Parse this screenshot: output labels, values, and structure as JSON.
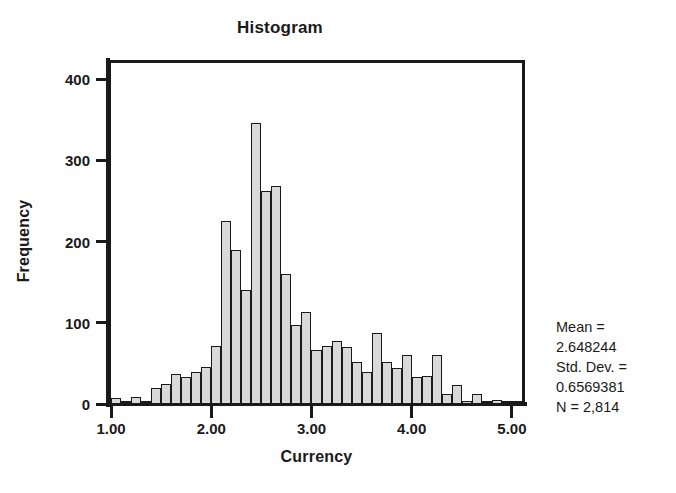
{
  "chart": {
    "title": "Histogram"
  },
  "axes": {
    "x": {
      "label": "Currency",
      "ticks": [
        "1.00",
        "2.00",
        "3.00",
        "4.00",
        "5.00"
      ],
      "tick_values": [
        1.0,
        2.0,
        3.0,
        4.0,
        5.0
      ]
    },
    "y": {
      "label": "Frequency",
      "ticks": [
        "0",
        "100",
        "200",
        "300",
        "400"
      ],
      "tick_values": [
        0,
        100,
        200,
        300,
        400
      ]
    }
  },
  "stats": {
    "mean_label": "Mean =",
    "mean_value": "2.648244",
    "sd_label": "Std. Dev. =",
    "sd_value": "0.6569381",
    "n_label": "N = 2,814"
  },
  "style": {
    "bar_fill": "#d9d9d9",
    "bar_stroke": "#1a1a1a",
    "axis_color": "#1a1a1a",
    "background": "#ffffff"
  },
  "chart_data": {
    "type": "bar",
    "subtype": "histogram",
    "title": "Histogram",
    "xlabel": "Currency",
    "ylabel": "Frequency",
    "xlim": [
      1.0,
      5.1
    ],
    "ylim": [
      0,
      420
    ],
    "grid": false,
    "legend": null,
    "bin_width": 0.1,
    "n": 2814,
    "mean": 2.648244,
    "std_dev": 0.6569381,
    "bin_starts": [
      1.0,
      1.1,
      1.2,
      1.3,
      1.4,
      1.5,
      1.6,
      1.7,
      1.8,
      1.9,
      2.0,
      2.1,
      2.2,
      2.3,
      2.4,
      2.5,
      2.6,
      2.7,
      2.8,
      2.9,
      3.0,
      3.1,
      3.2,
      3.3,
      3.4,
      3.5,
      3.6,
      3.7,
      3.8,
      3.9,
      4.0,
      4.1,
      4.2,
      4.3,
      4.4,
      4.5,
      4.6,
      4.7,
      4.8,
      4.9,
      5.0
    ],
    "categories": [
      "1.00",
      "1.10",
      "1.20",
      "1.30",
      "1.40",
      "1.50",
      "1.60",
      "1.70",
      "1.80",
      "1.90",
      "2.00",
      "2.10",
      "2.20",
      "2.30",
      "2.40",
      "2.50",
      "2.60",
      "2.70",
      "2.80",
      "2.90",
      "3.00",
      "3.10",
      "3.20",
      "3.30",
      "3.40",
      "3.50",
      "3.60",
      "3.70",
      "3.80",
      "3.90",
      "4.00",
      "4.10",
      "4.20",
      "4.30",
      "4.40",
      "4.50",
      "4.60",
      "4.70",
      "4.80",
      "4.90",
      "5.00"
    ],
    "values": [
      7,
      2,
      9,
      3,
      20,
      25,
      37,
      33,
      40,
      45,
      72,
      225,
      190,
      140,
      346,
      262,
      268,
      160,
      97,
      113,
      66,
      72,
      78,
      70,
      52,
      40,
      88,
      52,
      44,
      60,
      33,
      35,
      60,
      12,
      24,
      4,
      12,
      2,
      5,
      1,
      2
    ]
  }
}
